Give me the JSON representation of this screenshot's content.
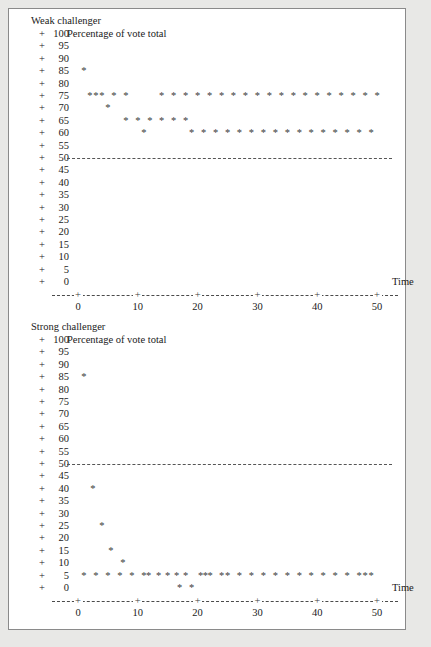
{
  "figure": {
    "background": "#e8e8e6",
    "panel_background": "#ffffff",
    "border_color": "#8a8a8a",
    "marker_glyph": "*",
    "axis_glyph": "+",
    "tick_glyph": "+"
  },
  "chart_data": [
    {
      "type": "scatter",
      "title": "Weak challenger",
      "subtitle": "Percentage of vote total",
      "xlabel": "Time",
      "ylabel": "Percentage of vote total",
      "xlim": [
        -2,
        54
      ],
      "ylim": [
        0,
        100
      ],
      "yticks": [
        100,
        95,
        90,
        85,
        80,
        75,
        70,
        65,
        60,
        55,
        50,
        45,
        40,
        35,
        30,
        25,
        20,
        15,
        10,
        5,
        0
      ],
      "xticks": [
        0,
        10,
        20,
        30,
        40,
        50
      ],
      "grid": false,
      "reference_line": {
        "y": 50,
        "style": "dashed",
        "label": ""
      },
      "points": [
        {
          "x": 1,
          "y": 85
        },
        {
          "x": 2,
          "y": 75
        },
        {
          "x": 3,
          "y": 75
        },
        {
          "x": 4,
          "y": 75
        },
        {
          "x": 5,
          "y": 70
        },
        {
          "x": 6,
          "y": 75
        },
        {
          "x": 8,
          "y": 75
        },
        {
          "x": 8,
          "y": 65
        },
        {
          "x": 10,
          "y": 65
        },
        {
          "x": 11,
          "y": 60
        },
        {
          "x": 12,
          "y": 65
        },
        {
          "x": 14,
          "y": 65
        },
        {
          "x": 16,
          "y": 65
        },
        {
          "x": 18,
          "y": 65
        },
        {
          "x": 14,
          "y": 75
        },
        {
          "x": 16,
          "y": 75
        },
        {
          "x": 18,
          "y": 75
        },
        {
          "x": 19,
          "y": 60
        },
        {
          "x": 20,
          "y": 75
        },
        {
          "x": 21,
          "y": 60
        },
        {
          "x": 22,
          "y": 75
        },
        {
          "x": 23,
          "y": 60
        },
        {
          "x": 24,
          "y": 75
        },
        {
          "x": 25,
          "y": 60
        },
        {
          "x": 26,
          "y": 75
        },
        {
          "x": 27,
          "y": 60
        },
        {
          "x": 28,
          "y": 75
        },
        {
          "x": 29,
          "y": 60
        },
        {
          "x": 30,
          "y": 75
        },
        {
          "x": 31,
          "y": 60
        },
        {
          "x": 32,
          "y": 75
        },
        {
          "x": 33,
          "y": 60
        },
        {
          "x": 34,
          "y": 75
        },
        {
          "x": 35,
          "y": 60
        },
        {
          "x": 36,
          "y": 75
        },
        {
          "x": 37,
          "y": 60
        },
        {
          "x": 38,
          "y": 75
        },
        {
          "x": 39,
          "y": 60
        },
        {
          "x": 40,
          "y": 75
        },
        {
          "x": 41,
          "y": 60
        },
        {
          "x": 42,
          "y": 75
        },
        {
          "x": 43,
          "y": 60
        },
        {
          "x": 44,
          "y": 75
        },
        {
          "x": 45,
          "y": 60
        },
        {
          "x": 46,
          "y": 75
        },
        {
          "x": 47,
          "y": 60
        },
        {
          "x": 48,
          "y": 75
        },
        {
          "x": 49,
          "y": 60
        },
        {
          "x": 50,
          "y": 75
        }
      ]
    },
    {
      "type": "scatter",
      "title": "Strong challenger",
      "subtitle": "Percentage of vote total",
      "xlabel": "Time",
      "ylabel": "Percentage of vote total",
      "xlim": [
        -2,
        54
      ],
      "ylim": [
        0,
        100
      ],
      "yticks": [
        100,
        95,
        90,
        85,
        80,
        75,
        70,
        65,
        60,
        55,
        50,
        45,
        40,
        35,
        30,
        25,
        20,
        15,
        10,
        5,
        0
      ],
      "xticks": [
        0,
        10,
        20,
        30,
        40,
        50
      ],
      "grid": false,
      "reference_line": {
        "y": 50,
        "style": "dashed",
        "label": ""
      },
      "points": [
        {
          "x": 1,
          "y": 85
        },
        {
          "x": 2.5,
          "y": 40
        },
        {
          "x": 4,
          "y": 25
        },
        {
          "x": 5.5,
          "y": 15
        },
        {
          "x": 7.5,
          "y": 10
        },
        {
          "x": 1,
          "y": 5
        },
        {
          "x": 3,
          "y": 5
        },
        {
          "x": 5,
          "y": 5
        },
        {
          "x": 7,
          "y": 5
        },
        {
          "x": 9,
          "y": 5
        },
        {
          "x": 11,
          "y": 5
        },
        {
          "x": 11.8,
          "y": 5
        },
        {
          "x": 13.5,
          "y": 5
        },
        {
          "x": 15,
          "y": 5
        },
        {
          "x": 16.5,
          "y": 5
        },
        {
          "x": 18,
          "y": 5
        },
        {
          "x": 17,
          "y": 0
        },
        {
          "x": 19,
          "y": 0
        },
        {
          "x": 20.5,
          "y": 5
        },
        {
          "x": 21.3,
          "y": 5
        },
        {
          "x": 22.1,
          "y": 5
        },
        {
          "x": 24,
          "y": 5
        },
        {
          "x": 25,
          "y": 5
        },
        {
          "x": 27,
          "y": 5
        },
        {
          "x": 29,
          "y": 5
        },
        {
          "x": 31,
          "y": 5
        },
        {
          "x": 33,
          "y": 5
        },
        {
          "x": 35,
          "y": 5
        },
        {
          "x": 37,
          "y": 5
        },
        {
          "x": 39,
          "y": 5
        },
        {
          "x": 41,
          "y": 5
        },
        {
          "x": 43,
          "y": 5
        },
        {
          "x": 45,
          "y": 5
        },
        {
          "x": 47,
          "y": 5
        },
        {
          "x": 48,
          "y": 5
        },
        {
          "x": 49,
          "y": 5
        }
      ]
    }
  ],
  "panels": [
    {
      "id": "weak",
      "title": "Weak challenger",
      "subtitle": "Percentage of vote total",
      "time_label": "Time"
    },
    {
      "id": "strong",
      "title": "Strong challenger",
      "subtitle": "Percentage of vote total",
      "time_label": "Time"
    }
  ]
}
